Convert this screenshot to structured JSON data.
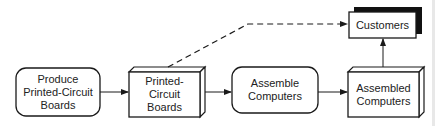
{
  "diagram": {
    "nodes": [
      {
        "id": "produce",
        "label": "Produce\nPrinted-Circuit\nBoards",
        "shape": "rounded-rect"
      },
      {
        "id": "pcb",
        "label": "Printed-\nCircuit\nBoards",
        "shape": "3d-box"
      },
      {
        "id": "assemble",
        "label": "Assemble\nComputers",
        "shape": "rounded-rect"
      },
      {
        "id": "assembled",
        "label": "Assembled\nComputers",
        "shape": "3d-box"
      },
      {
        "id": "customers",
        "label": "Customers",
        "shape": "shadow-box"
      }
    ],
    "edges": [
      {
        "from": "produce",
        "to": "pcb",
        "style": "solid"
      },
      {
        "from": "pcb",
        "to": "assemble",
        "style": "solid"
      },
      {
        "from": "assemble",
        "to": "assembled",
        "style": "solid"
      },
      {
        "from": "assembled",
        "to": "customers",
        "style": "solid"
      },
      {
        "from": "pcb",
        "to": "customers",
        "style": "dashed"
      }
    ],
    "colors": {
      "stroke": "#1a1a1a",
      "fill": "#ffffff",
      "text": "#222222"
    }
  }
}
